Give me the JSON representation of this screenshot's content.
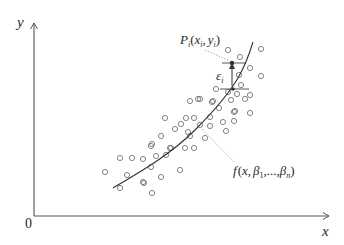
{
  "diagram": {
    "title": "",
    "type": "regression-scatter",
    "axes": {
      "y_label": "y",
      "x_label": "x",
      "origin_label": "0"
    },
    "labels": {
      "point_label": {
        "main": "P",
        "sub": "i",
        "open": "(",
        "x": "x",
        "xsub": "i",
        "comma": ",",
        "y": "y",
        "ysub": "i",
        "close": ")"
      },
      "residual_label": {
        "main": "ε",
        "sub": "i"
      },
      "curve_label": {
        "f": "f",
        "open": "(",
        "x": "x",
        "comma1": ",",
        "beta1": "β",
        "b1sub": "1",
        "dots": ",...,",
        "betan": "β",
        "bnsub": "n",
        "close": ")"
      }
    },
    "colors": {
      "axis": "#555555",
      "point": "#777777",
      "curve": "#333333",
      "leader": "#999999",
      "text": "#2a2a2a"
    }
  }
}
